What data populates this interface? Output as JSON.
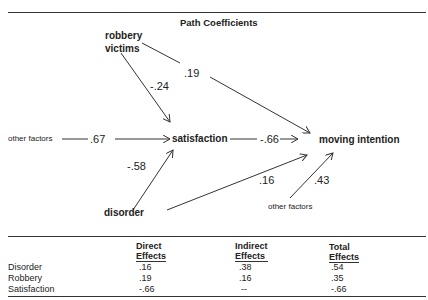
{
  "title": "Path Coefficients",
  "nodes": {
    "robbery": "robbery victims",
    "robbery_line1": "robbery",
    "robbery_line2": "victims",
    "satisfaction": "satisfaction",
    "moving_intention": "moving intention",
    "disorder": "disorder",
    "other_factors_left": "other factors",
    "other_factors_bottom": "other factors"
  },
  "paths": [
    {
      "from": "robbery victims",
      "to": "satisfaction",
      "coef": "-.24"
    },
    {
      "from": "robbery victims",
      "to": "moving intention",
      "coef": ".19"
    },
    {
      "from": "other factors",
      "to": "satisfaction",
      "coef": ".67"
    },
    {
      "from": "satisfaction",
      "to": "moving intention",
      "coef": "-.66"
    },
    {
      "from": "disorder",
      "to": "satisfaction",
      "coef": "-.58"
    },
    {
      "from": "disorder",
      "to": "moving intention",
      "coef": ".16"
    },
    {
      "from": "other factors",
      "to": "moving intention",
      "coef": ".43"
    }
  ],
  "table": {
    "headers": [
      {
        "line1": "",
        "line2": ""
      },
      {
        "line1": "Direct",
        "line2": "Effects"
      },
      {
        "line1": "Indirect",
        "line2": "Effects"
      },
      {
        "line1": "Total",
        "line2": "Effects"
      }
    ],
    "rows": [
      {
        "label": "Disorder",
        "direct": ".16",
        "indirect": ".38",
        "total": ".54"
      },
      {
        "label": "Robbery",
        "direct": ".19",
        "indirect": ".16",
        "total": ".35"
      },
      {
        "label": "Satisfaction",
        "direct": "-.66",
        "indirect": "--",
        "total": "-.66"
      }
    ]
  }
}
